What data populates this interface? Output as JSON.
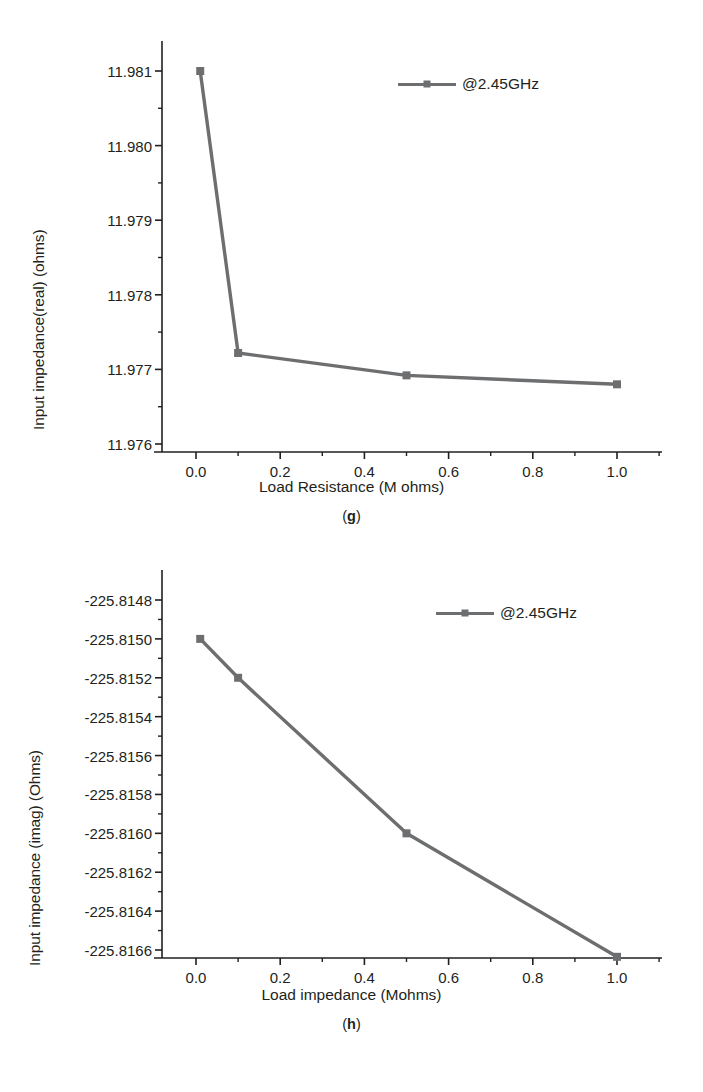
{
  "figure_panels": [
    {
      "id": "g",
      "caption": "(g)",
      "legend_label": "@2.45GHz",
      "ylabel": "Input impedance(real) (ohms)",
      "xlabel": "Load Resistance (M ohms)"
    },
    {
      "id": "h",
      "caption": "(h)",
      "legend_label": "@2.45GHz",
      "ylabel": "Input impedance (imag) (Ohms)",
      "xlabel": "Load impedance (Mohms)"
    }
  ],
  "colors": {
    "series": "#6d6e70",
    "axis": "#231f20",
    "text": "#231f20",
    "background": "#ffffff"
  },
  "chart_data": [
    {
      "type": "line",
      "panel": "g",
      "title": "",
      "xlabel": "Load Resistance (M ohms)",
      "ylabel": "Input impedance(real) (ohms)",
      "xlim": [
        -0.05,
        1.08
      ],
      "ylim": [
        11.976,
        11.9815
      ],
      "xticks": [
        0.0,
        0.2,
        0.4,
        0.6,
        0.8,
        1.0
      ],
      "xtick_labels": [
        "0.0",
        "0.2",
        "0.4",
        "0.6",
        "0.8",
        "1.0"
      ],
      "yticks": [
        11.976,
        11.977,
        11.978,
        11.979,
        11.98,
        11.981
      ],
      "ytick_labels": [
        "11.976",
        "11.977",
        "11.978",
        "11.979",
        "11.980",
        "11.981"
      ],
      "minor_ticks": true,
      "grid": false,
      "legend_position": "upper-right",
      "series": [
        {
          "name": "@2.45GHz",
          "marker": "square",
          "color": "#6d6e70",
          "x": [
            0.01,
            0.1,
            0.5,
            1.0
          ],
          "y": [
            11.981,
            11.97722,
            11.97692,
            11.9768
          ]
        }
      ]
    },
    {
      "type": "line",
      "panel": "h",
      "title": "",
      "xlabel": "Load impedance (Mohms)",
      "ylabel": "Input impedance (imag) (Ohms)",
      "xlim": [
        -0.05,
        1.08
      ],
      "ylim": [
        -225.8167,
        -225.8148
      ],
      "xticks": [
        0.0,
        0.2,
        0.4,
        0.6,
        0.8,
        1.0
      ],
      "xtick_labels": [
        "0.0",
        "0.2",
        "0.4",
        "0.6",
        "0.8",
        "1.0"
      ],
      "yticks": [
        -225.8166,
        -225.8164,
        -225.8162,
        -225.816,
        -225.8158,
        -225.8156,
        -225.8154,
        -225.8152,
        -225.815,
        -225.8148
      ],
      "ytick_labels": [
        "-225.8166",
        "-225.8164",
        "-225.8162",
        "-225.8160",
        "-225.8158",
        "-225.8156",
        "-225.8154",
        "-225.8152",
        "-225.8150",
        "-225.8148"
      ],
      "minor_ticks": true,
      "grid": false,
      "legend_position": "upper-right",
      "series": [
        {
          "name": "@2.45GHz",
          "marker": "square",
          "color": "#6d6e70",
          "x": [
            0.01,
            0.1,
            0.5,
            1.0
          ],
          "y": [
            -225.815,
            -225.8152,
            -225.816,
            -225.816635
          ]
        }
      ]
    }
  ]
}
